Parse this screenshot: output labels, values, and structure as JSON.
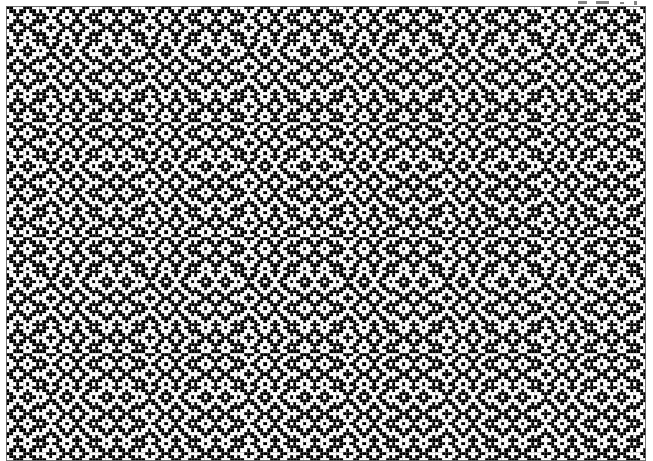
{
  "figure": {
    "kind": "weaving-draft-drawdown",
    "canvas": {
      "width": 653,
      "height": 461
    }
  },
  "grid": {
    "origin_x": 6,
    "origin_y": 6,
    "cell_size": 3.3,
    "columns": 194,
    "rows": 138,
    "minor_gridline_color": "#c8c8c8",
    "major_gridline_color": "#8c8c8c",
    "major_gridline_every": 5,
    "border_color": "#646464",
    "show_grid": true
  },
  "colors": {
    "warp_up": "#000000",
    "warp_down": "#ffffff",
    "background": "#ffffff",
    "artifact": "#5a5a5a"
  },
  "draft": {
    "shafts": 4,
    "treadles": 4,
    "threading_label": "Threading (rose path / mirrored point twill)",
    "treadling_label": "Treadling (rose path, as-drawn-in)",
    "tieup_label": "Tie-up (2/2 twill)",
    "tieup": [
      [
        1,
        1,
        0,
        0
      ],
      [
        0,
        1,
        1,
        0
      ],
      [
        0,
        0,
        1,
        1
      ],
      [
        1,
        0,
        0,
        1
      ]
    ],
    "threading_unit": [
      0,
      1,
      2,
      3,
      2,
      1,
      0,
      1,
      2,
      3,
      2,
      3,
      0,
      1,
      0,
      3,
      2,
      1,
      0,
      1,
      2,
      3,
      2,
      1,
      0,
      3,
      2,
      3,
      2,
      1
    ],
    "threading_repeat_length": 30,
    "treadling_unit": [
      0,
      1,
      2,
      3,
      2,
      1,
      0,
      1,
      2,
      3,
      2,
      3,
      0,
      1,
      0,
      3,
      2,
      1,
      0,
      1,
      2,
      3,
      2,
      1,
      0,
      3,
      2,
      3,
      2,
      1,
      0,
      1,
      2,
      3,
      2
    ],
    "treadling_repeat_length": 35,
    "weft_float_length": 3,
    "motif": "diamond-and-X",
    "horizontal_repeat_px": 100,
    "vertical_repeat_px": 115
  },
  "artifacts": {
    "label": "Faint scanner marks above grid, top-right",
    "marks": [
      {
        "x": 578,
        "y": 1,
        "w": 9,
        "h": 3
      },
      {
        "x": 596,
        "y": 1,
        "w": 13,
        "h": 3
      },
      {
        "x": 620,
        "y": 2,
        "w": 4,
        "h": 2
      },
      {
        "x": 634,
        "y": 1,
        "w": 3,
        "h": 4
      }
    ]
  }
}
